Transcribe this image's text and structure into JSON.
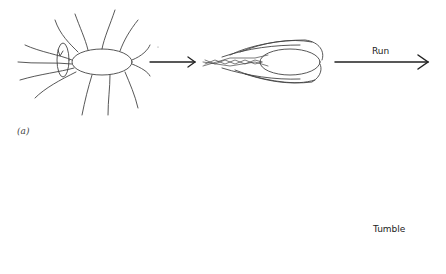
{
  "diagram": {
    "panel_label": "(a)",
    "labels": {
      "run": "Run",
      "tumble": "Tumble"
    },
    "stages": [
      {
        "id": "top-1",
        "description": "cell with peritrichous flagella, rotation arrow at rear"
      },
      {
        "id": "top-2",
        "description": "flagella bundled behind cell"
      },
      {
        "id": "top-3",
        "description": "run arrow"
      },
      {
        "id": "bottom-1",
        "description": "bundled flagella with rotation arrow"
      },
      {
        "id": "bottom-2",
        "description": "flagella splayed out"
      },
      {
        "id": "bottom-3",
        "description": "tumble wavy arrow"
      }
    ],
    "colors": {
      "stroke": "#333333",
      "background": "#ffffff"
    }
  }
}
